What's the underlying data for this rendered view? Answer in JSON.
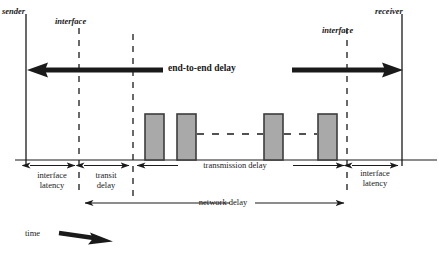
{
  "diagram": {
    "endpoints": {
      "sender": "sender",
      "receiver": "receiver",
      "interface_left": "interface",
      "interface_right": "interface"
    },
    "measures": {
      "end_to_end": "end-to-end delay",
      "interface_latency_left": "interface\nlatency",
      "interface_latency_left_line1": "interface",
      "interface_latency_left_line2": "latency",
      "transit_delay_line1": "transit",
      "transit_delay_line2": "delay",
      "transmission_delay": "transmission delay",
      "network_delay": "network delay",
      "interface_latency_right_line1": "interface",
      "interface_latency_right_line2": "latency"
    },
    "axis": {
      "time_label": "time"
    },
    "colors": {
      "packet_fill": "#a9a9a9",
      "packet_stroke": "#3c3c3c",
      "line": "#1a1a1a",
      "background": "#ffffff"
    },
    "packets": [
      {
        "id": "packet-1",
        "x": 145,
        "width": 19
      },
      {
        "id": "packet-2",
        "x": 177,
        "width": 19
      },
      {
        "id": "packet-3",
        "x": 264,
        "width": 19
      },
      {
        "id": "packet-4",
        "x": 318,
        "width": 19
      }
    ],
    "vertical_lines": [
      {
        "id": "sender-axis",
        "x": 26,
        "style": "solid"
      },
      {
        "id": "interface-left-axis",
        "x": 79,
        "style": "dashed"
      },
      {
        "id": "transit-boundary-axis",
        "x": 133,
        "style": "dashed"
      },
      {
        "id": "interface-right-axis",
        "x": 347,
        "style": "dashed"
      },
      {
        "id": "receiver-axis",
        "x": 402,
        "style": "solid"
      }
    ]
  }
}
